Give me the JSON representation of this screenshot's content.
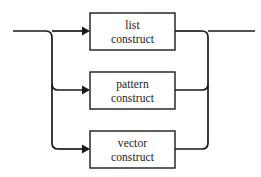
{
  "diagram": {
    "type": "railroad-syntax-diagram",
    "title": "",
    "background_color": "#ffffff",
    "line_color": "#1a1a1a",
    "box_fill_color": "#ffffff",
    "entry_rail": {
      "name": "input-rail",
      "y": 31,
      "x_start": 13,
      "x_end": 52
    },
    "exit_rail": {
      "name": "output-rail",
      "y": 31,
      "x_start": 208,
      "x_end": 255
    },
    "branch_trunk_left_x": 52,
    "branch_trunk_right_x": 208,
    "alternatives": [
      {
        "id": "list-construct",
        "line1": "list",
        "line2": "construct",
        "box": {
          "x": 90,
          "y": 13,
          "width": 85,
          "height": 37
        },
        "rail_y": 31
      },
      {
        "id": "pattern-construct",
        "line1": "pattern",
        "line2": "construct",
        "box": {
          "x": 90,
          "y": 72,
          "width": 85,
          "height": 37
        },
        "rail_y": 90
      },
      {
        "id": "vector-construct",
        "line1": "vector",
        "line2": "construct",
        "box": {
          "x": 90,
          "y": 131,
          "width": 85,
          "height": 37
        },
        "rail_y": 149
      }
    ]
  }
}
